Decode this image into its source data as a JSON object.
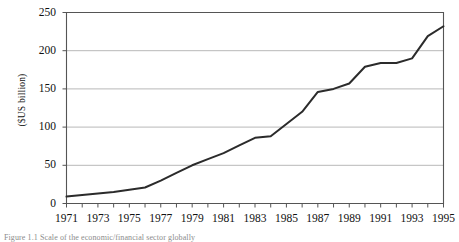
{
  "chart_data": {
    "type": "line",
    "title": "",
    "xlabel": "",
    "ylabel": "($US billion)",
    "ylim": [
      0,
      250
    ],
    "xlim": [
      1971,
      1995
    ],
    "yticks": [
      "0",
      "50",
      "100",
      "150",
      "200",
      "250"
    ],
    "ytick_values": [
      0,
      50,
      100,
      150,
      200,
      250
    ],
    "xticks": [
      "1971",
      "1973",
      "1975",
      "1977",
      "1979",
      "1981",
      "1983",
      "1985",
      "1987",
      "1989",
      "1991",
      "1993",
      "1995"
    ],
    "xtick_values": [
      1971,
      1973,
      1975,
      1977,
      1979,
      1981,
      1983,
      1985,
      1987,
      1989,
      1991,
      1993,
      1995
    ],
    "grid": "horizontal",
    "legend": "none",
    "x": [
      1971,
      1972,
      1973,
      1974,
      1975,
      1976,
      1977,
      1978,
      1979,
      1980,
      1981,
      1982,
      1983,
      1984,
      1985,
      1986,
      1987,
      1988,
      1989,
      1990,
      1991,
      1992,
      1993,
      1994,
      1995
    ],
    "series": [
      {
        "name": "value",
        "values": [
          9,
          11,
          13,
          15,
          18,
          21,
          30,
          40,
          50,
          58,
          66,
          76,
          86,
          88,
          104,
          120,
          146,
          150,
          157,
          179,
          184,
          184,
          190,
          219,
          232
        ]
      }
    ],
    "line_color": "#2b2b2b",
    "grid_color": "#b0b0b0",
    "axis_color": "#555555"
  },
  "axes": {
    "ylabel": "($US billion)"
  },
  "caption": {
    "text": "Figure 1.1   Scale of the economic/financial sector globally"
  }
}
